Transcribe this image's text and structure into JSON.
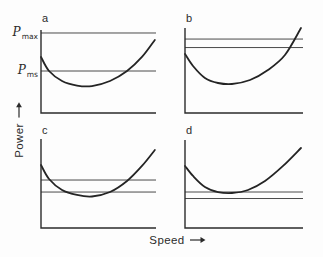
{
  "figure": {
    "background": "#fdfdfd",
    "ink_color": "#2b2b2b",
    "available_line_color": "#4a4a4a"
  },
  "labels": {
    "power_axis": "Power",
    "speed_axis": "Speed",
    "p_symbol": "P",
    "pmax_subscript": "max",
    "pms_subscript": "ms"
  },
  "icons": {
    "axis_arrow": "right-arrow"
  },
  "chart_data": {
    "type": "line",
    "title": "",
    "xlabel": "Speed",
    "ylabel": "Power",
    "grid": false,
    "legend": "none",
    "axes_numeric": false,
    "value_scale": "normalized 0-1 within each panel (x: 0=left axis, 1=right end; y: 0=bottom axis, 1=top of axis)",
    "panels": [
      {
        "id": "a",
        "label": "a",
        "power_available_levels": [
          0.964,
          0.506
        ],
        "level_labels": [
          "P max",
          "P ms"
        ],
        "power_required_curve": [
          [
            0.0,
            0.675
          ],
          [
            0.07,
            0.506
          ],
          [
            0.183,
            0.386
          ],
          [
            0.313,
            0.331
          ],
          [
            0.443,
            0.325
          ],
          [
            0.6,
            0.386
          ],
          [
            0.748,
            0.506
          ],
          [
            0.878,
            0.675
          ],
          [
            0.99,
            0.88
          ]
        ]
      },
      {
        "id": "b",
        "label": "b",
        "power_available_levels": [
          0.87,
          0.77
        ],
        "level_labels": [],
        "power_required_curve": [
          [
            0.0,
            0.694
          ],
          [
            0.068,
            0.553
          ],
          [
            0.169,
            0.412
          ],
          [
            0.28,
            0.353
          ],
          [
            0.398,
            0.341
          ],
          [
            0.551,
            0.388
          ],
          [
            0.703,
            0.506
          ],
          [
            0.847,
            0.682
          ],
          [
            0.983,
            1.0
          ]
        ]
      },
      {
        "id": "c",
        "label": "c",
        "power_available_levels": [
          0.539,
          0.404
        ],
        "level_labels": [],
        "power_required_curve": [
          [
            0.0,
            0.708
          ],
          [
            0.07,
            0.551
          ],
          [
            0.183,
            0.427
          ],
          [
            0.313,
            0.371
          ],
          [
            0.443,
            0.354
          ],
          [
            0.6,
            0.404
          ],
          [
            0.748,
            0.528
          ],
          [
            0.878,
            0.697
          ],
          [
            0.99,
            0.876
          ]
        ]
      },
      {
        "id": "d",
        "label": "d",
        "power_available_levels": [
          0.409,
          0.335
        ],
        "level_labels": [],
        "power_required_curve": [
          [
            0.0,
            0.705
          ],
          [
            0.068,
            0.591
          ],
          [
            0.169,
            0.466
          ],
          [
            0.28,
            0.409
          ],
          [
            0.398,
            0.398
          ],
          [
            0.534,
            0.432
          ],
          [
            0.678,
            0.534
          ],
          [
            0.831,
            0.705
          ],
          [
            0.983,
            0.909
          ]
        ]
      }
    ]
  }
}
